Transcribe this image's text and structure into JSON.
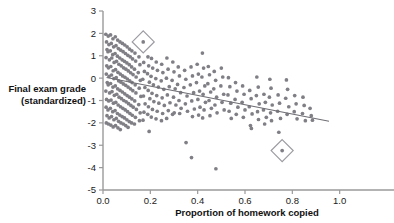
{
  "chart_data": {
    "type": "scatter",
    "title": "",
    "xlabel": "Proportion of homework copied",
    "ylabel": "Final exam grade (standardized)",
    "ylabel_lines": [
      "Final exam grade",
      "(standardized)"
    ],
    "xlim": [
      0.0,
      1.2
    ],
    "ylim": [
      -5,
      3
    ],
    "xticks": [
      0.0,
      0.2,
      0.4,
      0.6,
      0.8,
      1.0
    ],
    "xtick_labels": [
      "0.0",
      "0.2",
      "0.4",
      "0.6",
      "0.8",
      "1.0"
    ],
    "yticks": [
      3,
      2,
      1,
      0,
      -1,
      -2,
      -3,
      -4,
      -5
    ],
    "ytick_labels": [
      "3",
      "2",
      "1",
      "0",
      "-1",
      "-2",
      "-3",
      "-4",
      "-5"
    ],
    "grid": false,
    "legend": null,
    "point_color": "#7f7f85",
    "line_color": "#6e6e74",
    "axis_color": "#9a9a9a",
    "trend_line": {
      "label": "least-squares regression line",
      "x_start": 0.015,
      "y_start": 0.03,
      "x_end": 0.955,
      "y_end": -1.93,
      "slope": -2.1,
      "intercept": 0.06
    },
    "annotations": [
      {
        "name": "outlier-diamond-upper",
        "shape": "diamond",
        "x": 0.17,
        "y": 1.62
      },
      {
        "name": "outlier-diamond-lower",
        "shape": "diamond",
        "x": 0.757,
        "y": -3.24
      }
    ],
    "points": [
      [
        0.012,
        1.96
      ],
      [
        0.015,
        1.62
      ],
      [
        0.017,
        1.28
      ],
      [
        0.013,
        0.92
      ],
      [
        0.016,
        0.55
      ],
      [
        0.014,
        0.18
      ],
      [
        0.018,
        -0.2
      ],
      [
        0.012,
        -0.58
      ],
      [
        0.015,
        -0.95
      ],
      [
        0.013,
        -1.3
      ],
      [
        0.017,
        -1.68
      ],
      [
        0.014,
        -2.0
      ],
      [
        0.022,
        1.88
      ],
      [
        0.025,
        1.5
      ],
      [
        0.021,
        1.18
      ],
      [
        0.027,
        0.82
      ],
      [
        0.023,
        0.46
      ],
      [
        0.026,
        0.08
      ],
      [
        0.022,
        -0.3
      ],
      [
        0.028,
        -0.66
      ],
      [
        0.024,
        -1.02
      ],
      [
        0.021,
        -1.42
      ],
      [
        0.026,
        -1.78
      ],
      [
        0.023,
        -2.05
      ],
      [
        0.032,
        1.93
      ],
      [
        0.035,
        1.55
      ],
      [
        0.031,
        1.22
      ],
      [
        0.037,
        0.9
      ],
      [
        0.033,
        0.52
      ],
      [
        0.036,
        0.14
      ],
      [
        0.032,
        -0.24
      ],
      [
        0.038,
        -0.6
      ],
      [
        0.034,
        -0.98
      ],
      [
        0.031,
        -1.35
      ],
      [
        0.036,
        -1.72
      ],
      [
        0.033,
        -2.1
      ],
      [
        0.042,
        1.76
      ],
      [
        0.045,
        1.4
      ],
      [
        0.041,
        1.05
      ],
      [
        0.047,
        0.7
      ],
      [
        0.043,
        0.33
      ],
      [
        0.046,
        -0.02
      ],
      [
        0.042,
        -0.4
      ],
      [
        0.048,
        -0.77
      ],
      [
        0.044,
        -1.12
      ],
      [
        0.041,
        -1.5
      ],
      [
        0.046,
        -1.86
      ],
      [
        0.043,
        -2.18
      ],
      [
        0.052,
        1.85
      ],
      [
        0.055,
        1.45
      ],
      [
        0.051,
        1.1
      ],
      [
        0.057,
        0.75
      ],
      [
        0.053,
        0.38
      ],
      [
        0.056,
        0.02
      ],
      [
        0.052,
        -0.35
      ],
      [
        0.058,
        -0.72
      ],
      [
        0.054,
        -1.08
      ],
      [
        0.051,
        -1.45
      ],
      [
        0.056,
        -1.8
      ],
      [
        0.053,
        -2.12
      ],
      [
        0.062,
        1.7
      ],
      [
        0.065,
        1.32
      ],
      [
        0.061,
        0.98
      ],
      [
        0.067,
        0.62
      ],
      [
        0.063,
        0.26
      ],
      [
        0.066,
        -0.12
      ],
      [
        0.062,
        -0.48
      ],
      [
        0.068,
        -0.85
      ],
      [
        0.064,
        -1.2
      ],
      [
        0.061,
        -1.58
      ],
      [
        0.066,
        -1.93
      ],
      [
        0.063,
        -2.22
      ],
      [
        0.072,
        1.62
      ],
      [
        0.075,
        1.25
      ],
      [
        0.071,
        0.9
      ],
      [
        0.077,
        0.55
      ],
      [
        0.073,
        0.18
      ],
      [
        0.076,
        -0.18
      ],
      [
        0.072,
        -0.55
      ],
      [
        0.078,
        -0.92
      ],
      [
        0.074,
        -1.28
      ],
      [
        0.071,
        -1.65
      ],
      [
        0.076,
        -2.0
      ],
      [
        0.073,
        -2.3
      ],
      [
        0.082,
        1.55
      ],
      [
        0.085,
        1.18
      ],
      [
        0.081,
        0.82
      ],
      [
        0.087,
        0.46
      ],
      [
        0.083,
        0.1
      ],
      [
        0.086,
        -0.26
      ],
      [
        0.082,
        -0.62
      ],
      [
        0.088,
        -1.0
      ],
      [
        0.084,
        -1.35
      ],
      [
        0.081,
        -1.72
      ],
      [
        0.086,
        -2.05
      ],
      [
        0.092,
        1.48
      ],
      [
        0.095,
        1.1
      ],
      [
        0.091,
        0.75
      ],
      [
        0.097,
        0.4
      ],
      [
        0.093,
        0.04
      ],
      [
        0.096,
        -0.32
      ],
      [
        0.092,
        -0.7
      ],
      [
        0.098,
        -1.06
      ],
      [
        0.094,
        -1.42
      ],
      [
        0.091,
        -1.78
      ],
      [
        0.096,
        -2.12
      ],
      [
        0.102,
        1.4
      ],
      [
        0.105,
        1.02
      ],
      [
        0.101,
        0.68
      ],
      [
        0.107,
        0.32
      ],
      [
        0.103,
        -0.04
      ],
      [
        0.106,
        -0.4
      ],
      [
        0.102,
        -0.78
      ],
      [
        0.108,
        -1.14
      ],
      [
        0.104,
        -1.5
      ],
      [
        0.101,
        -1.86
      ],
      [
        0.106,
        -2.2
      ],
      [
        0.112,
        1.3
      ],
      [
        0.115,
        0.95
      ],
      [
        0.111,
        0.6
      ],
      [
        0.117,
        0.24
      ],
      [
        0.113,
        -0.12
      ],
      [
        0.116,
        -0.48
      ],
      [
        0.112,
        -0.85
      ],
      [
        0.118,
        -1.22
      ],
      [
        0.114,
        -1.58
      ],
      [
        0.111,
        -1.94
      ],
      [
        0.122,
        1.22
      ],
      [
        0.125,
        0.86
      ],
      [
        0.121,
        0.5
      ],
      [
        0.127,
        0.16
      ],
      [
        0.123,
        -0.2
      ],
      [
        0.126,
        -0.56
      ],
      [
        0.122,
        -0.93
      ],
      [
        0.128,
        -1.3
      ],
      [
        0.124,
        -1.66
      ],
      [
        0.121,
        -2.0
      ],
      [
        0.135,
        1.12
      ],
      [
        0.138,
        0.76
      ],
      [
        0.133,
        0.4
      ],
      [
        0.14,
        0.05
      ],
      [
        0.136,
        -0.3
      ],
      [
        0.139,
        -0.66
      ],
      [
        0.134,
        -1.02
      ],
      [
        0.141,
        -1.4
      ],
      [
        0.137,
        -1.75
      ],
      [
        0.133,
        -2.05
      ],
      [
        0.152,
        0.95
      ],
      [
        0.156,
        0.6
      ],
      [
        0.149,
        0.25
      ],
      [
        0.158,
        -0.1
      ],
      [
        0.153,
        -0.45
      ],
      [
        0.16,
        -0.82
      ],
      [
        0.151,
        -1.18
      ],
      [
        0.157,
        -1.55
      ],
      [
        0.154,
        -1.9
      ],
      [
        0.17,
        1.62
      ],
      [
        0.172,
        0.7
      ],
      [
        0.175,
        0.3
      ],
      [
        0.168,
        -0.05
      ],
      [
        0.177,
        -0.42
      ],
      [
        0.171,
        -0.8
      ],
      [
        0.178,
        -1.15
      ],
      [
        0.173,
        -1.52
      ],
      [
        0.169,
        -1.88
      ],
      [
        0.19,
        0.95
      ],
      [
        0.193,
        0.55
      ],
      [
        0.188,
        0.2
      ],
      [
        0.196,
        -0.18
      ],
      [
        0.191,
        -0.55
      ],
      [
        0.198,
        -0.92
      ],
      [
        0.192,
        -1.28
      ],
      [
        0.189,
        -1.62
      ],
      [
        0.195,
        -2.38
      ],
      [
        0.205,
        0.88
      ],
      [
        0.21,
        0.45
      ],
      [
        0.203,
        0.08
      ],
      [
        0.213,
        -0.3
      ],
      [
        0.207,
        -0.68
      ],
      [
        0.215,
        -1.05
      ],
      [
        0.209,
        -1.4
      ],
      [
        0.204,
        -1.74
      ],
      [
        0.225,
        0.72
      ],
      [
        0.23,
        0.35
      ],
      [
        0.223,
        -0.02
      ],
      [
        0.234,
        -0.4
      ],
      [
        0.227,
        -0.78
      ],
      [
        0.236,
        -1.12
      ],
      [
        0.229,
        -1.48
      ],
      [
        0.224,
        -1.82
      ],
      [
        0.248,
        0.62
      ],
      [
        0.253,
        0.25
      ],
      [
        0.246,
        -0.12
      ],
      [
        0.257,
        -0.5
      ],
      [
        0.25,
        -0.88
      ],
      [
        0.259,
        -1.22
      ],
      [
        0.252,
        -1.58
      ],
      [
        0.247,
        -1.9
      ],
      [
        0.27,
        0.9
      ],
      [
        0.275,
        0.4
      ],
      [
        0.268,
        0.0
      ],
      [
        0.28,
        -0.38
      ],
      [
        0.272,
        -0.75
      ],
      [
        0.283,
        -1.1
      ],
      [
        0.276,
        -1.45
      ],
      [
        0.269,
        -1.8
      ],
      [
        0.295,
        0.72
      ],
      [
        0.3,
        0.28
      ],
      [
        0.292,
        -0.1
      ],
      [
        0.305,
        -0.48
      ],
      [
        0.298,
        -0.85
      ],
      [
        0.308,
        -1.2
      ],
      [
        0.301,
        -1.55
      ],
      [
        0.294,
        -1.62
      ],
      [
        0.318,
        0.5
      ],
      [
        0.323,
        0.1
      ],
      [
        0.315,
        -0.28
      ],
      [
        0.328,
        -0.65
      ],
      [
        0.321,
        -1.0
      ],
      [
        0.33,
        -1.35
      ],
      [
        0.324,
        -1.58
      ],
      [
        0.345,
        0.35
      ],
      [
        0.35,
        -0.05
      ],
      [
        0.342,
        -0.42
      ],
      [
        0.355,
        -0.8
      ],
      [
        0.348,
        -1.15
      ],
      [
        0.357,
        -1.48
      ],
      [
        0.351,
        -2.88
      ],
      [
        0.372,
        0.5
      ],
      [
        0.378,
        0.1
      ],
      [
        0.369,
        -0.3
      ],
      [
        0.383,
        -0.65
      ],
      [
        0.375,
        -1.02
      ],
      [
        0.386,
        -1.38
      ],
      [
        0.378,
        -1.72
      ],
      [
        0.374,
        -3.55
      ],
      [
        0.398,
        0.62
      ],
      [
        0.403,
        0.18
      ],
      [
        0.395,
        -0.2
      ],
      [
        0.408,
        -0.58
      ],
      [
        0.401,
        -0.95
      ],
      [
        0.41,
        -1.3
      ],
      [
        0.404,
        -1.65
      ],
      [
        0.42,
        1.12
      ],
      [
        0.425,
        0.45
      ],
      [
        0.418,
        0.05
      ],
      [
        0.43,
        -0.35
      ],
      [
        0.423,
        -0.72
      ],
      [
        0.433,
        -1.08
      ],
      [
        0.427,
        -1.42
      ],
      [
        0.421,
        -1.78
      ],
      [
        0.445,
        0.52
      ],
      [
        0.45,
        0.15
      ],
      [
        0.443,
        -0.25
      ],
      [
        0.455,
        -0.62
      ],
      [
        0.448,
        -1.0
      ],
      [
        0.458,
        -1.35
      ],
      [
        0.452,
        -1.68
      ],
      [
        0.47,
        0.3
      ],
      [
        0.476,
        -0.1
      ],
      [
        0.468,
        -0.48
      ],
      [
        0.48,
        -0.85
      ],
      [
        0.473,
        -1.2
      ],
      [
        0.482,
        -1.55
      ],
      [
        0.477,
        -4.05
      ],
      [
        0.5,
        0.45
      ],
      [
        0.506,
        0.05
      ],
      [
        0.498,
        -0.35
      ],
      [
        0.51,
        -0.72
      ],
      [
        0.503,
        -1.08
      ],
      [
        0.512,
        -1.42
      ],
      [
        0.53,
        0.02
      ],
      [
        0.536,
        -0.38
      ],
      [
        0.528,
        -0.75
      ],
      [
        0.54,
        -1.12
      ],
      [
        0.533,
        -1.48
      ],
      [
        0.542,
        -1.8
      ],
      [
        0.56,
        -0.2
      ],
      [
        0.566,
        -0.58
      ],
      [
        0.558,
        -0.95
      ],
      [
        0.57,
        -1.3
      ],
      [
        0.563,
        -1.62
      ],
      [
        0.59,
        -0.35
      ],
      [
        0.596,
        -0.72
      ],
      [
        0.588,
        -1.08
      ],
      [
        0.6,
        -1.42
      ],
      [
        0.593,
        -1.75
      ],
      [
        0.62,
        -0.55
      ],
      [
        0.626,
        -0.92
      ],
      [
        0.618,
        -1.28
      ],
      [
        0.63,
        -1.6
      ],
      [
        0.623,
        -2.12
      ],
      [
        0.627,
        -2.25
      ],
      [
        0.65,
        0.05
      ],
      [
        0.656,
        -0.4
      ],
      [
        0.648,
        -0.78
      ],
      [
        0.66,
        -1.15
      ],
      [
        0.653,
        -1.5
      ],
      [
        0.657,
        -1.85
      ],
      [
        0.68,
        -0.72
      ],
      [
        0.686,
        -1.08
      ],
      [
        0.678,
        -1.42
      ],
      [
        0.69,
        -1.75
      ],
      [
        0.683,
        -2.05
      ],
      [
        0.705,
        -0.05
      ],
      [
        0.71,
        -0.45
      ],
      [
        0.703,
        -0.85
      ],
      [
        0.715,
        -1.2
      ],
      [
        0.708,
        -1.55
      ],
      [
        0.712,
        -1.9
      ],
      [
        0.74,
        -0.75
      ],
      [
        0.746,
        -1.12
      ],
      [
        0.738,
        -1.48
      ],
      [
        0.75,
        -1.8
      ],
      [
        0.743,
        -2.42
      ],
      [
        0.757,
        -3.24
      ],
      [
        0.775,
        -0.08
      ],
      [
        0.78,
        -0.5
      ],
      [
        0.772,
        -0.9
      ],
      [
        0.785,
        -1.28
      ],
      [
        0.778,
        -1.62
      ],
      [
        0.81,
        -0.78
      ],
      [
        0.816,
        -1.15
      ],
      [
        0.808,
        -1.5
      ],
      [
        0.82,
        -1.82
      ],
      [
        0.845,
        -0.85
      ],
      [
        0.85,
        -1.22
      ],
      [
        0.843,
        -1.58
      ],
      [
        0.855,
        -1.9
      ],
      [
        0.875,
        -1.35
      ],
      [
        0.88,
        -1.68
      ],
      [
        0.885,
        -1.88
      ]
    ]
  }
}
